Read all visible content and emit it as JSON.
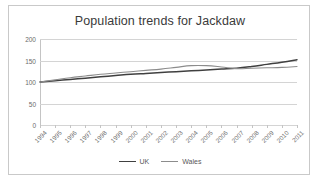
{
  "chart_data": {
    "type": "line",
    "title": "Population trends for Jackdaw",
    "xlabel": "",
    "ylabel": "",
    "ylim": [
      0,
      200
    ],
    "yticks": [
      0,
      50,
      100,
      150,
      200
    ],
    "grid": true,
    "legend_position": "bottom-center",
    "categories": [
      "1994",
      "1995",
      "1996",
      "1997",
      "1998",
      "1999",
      "2000",
      "2001",
      "2002",
      "2003",
      "2004",
      "2005",
      "2006",
      "2007",
      "2008",
      "2009",
      "2010",
      "2011"
    ],
    "series": [
      {
        "name": "UK",
        "color": "#404040",
        "values": [
          100,
          103,
          106,
          109,
          112,
          115,
          118,
          120,
          122,
          124,
          126,
          128,
          130,
          132,
          136,
          141,
          146,
          152
        ]
      },
      {
        "name": "Wales",
        "color": "#8c8c8c",
        "values": [
          100,
          105,
          110,
          114,
          118,
          121,
          124,
          127,
          130,
          134,
          138,
          138,
          135,
          131,
          132,
          133,
          134,
          136
        ]
      }
    ]
  },
  "colors": {
    "frame_border": "#c9c9c9",
    "gridline": "#d4d4d4",
    "axis": "#c4c4c4",
    "title_text": "#3a3a3a",
    "tick_text": "#6b6b6b",
    "legend_text": "#585858",
    "background": "#ffffff"
  }
}
